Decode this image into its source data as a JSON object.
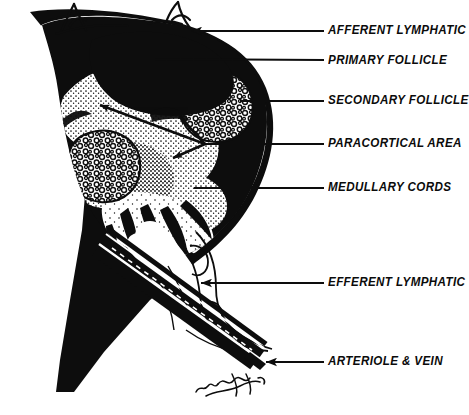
{
  "figure": {
    "ink_color": "#0d0d0d",
    "background_color": "#ffffff",
    "signature": "w.s.brunet"
  },
  "labels": [
    {
      "id": "afferent-lymphatic",
      "text": "AFFERENT LYMPHATIC",
      "x": 328,
      "y": 23,
      "leader": {
        "type": "arrow",
        "x1": 324,
        "y1": 31,
        "x2": 191,
        "y2": 31
      }
    },
    {
      "id": "primary-follicle",
      "text": "PRIMARY FOLLICLE",
      "x": 328,
      "y": 53,
      "leader": {
        "type": "line",
        "x1": 324,
        "y1": 60,
        "x2": 154,
        "y2": 59
      }
    },
    {
      "id": "secondary-follicle",
      "text": "SECONDARY FOLLICLE",
      "x": 328,
      "y": 93,
      "leader": {
        "type": "line",
        "x1": 324,
        "y1": 101,
        "x2": 240,
        "y2": 101
      }
    },
    {
      "id": "paracortical-area",
      "text": "PARACORTICAL AREA",
      "x": 328,
      "y": 136,
      "leader": {
        "type": "line",
        "x1": 324,
        "y1": 144,
        "x2": 205,
        "y2": 144
      }
    },
    {
      "id": "medullary-cords",
      "text": "MEDULLARY CORDS",
      "x": 328,
      "y": 180,
      "leader": {
        "type": "line",
        "x1": 324,
        "y1": 188,
        "x2": 194,
        "y2": 188
      }
    },
    {
      "id": "efferent-lymphatic",
      "text": "EFFERENT LYMPHATIC",
      "x": 328,
      "y": 275,
      "leader": {
        "type": "arrow",
        "x1": 324,
        "y1": 283,
        "x2": 201,
        "y2": 283
      }
    },
    {
      "id": "arteriole-and-vein",
      "text": "ARTERIOLE & VEIN",
      "x": 328,
      "y": 354,
      "leader": {
        "type": "arrow",
        "x1": 324,
        "y1": 362,
        "x2": 266,
        "y2": 362
      }
    }
  ],
  "internal_arrows": [
    {
      "id": "arrow-to-secondary-follicle-left",
      "x1": 205,
      "y1": 144,
      "x2": 96,
      "y2": 103
    },
    {
      "id": "arrow-to-paracortex-upper",
      "x1": 205,
      "y1": 144,
      "x2": 176,
      "y2": 113
    },
    {
      "id": "arrow-to-paracortex-lower",
      "x1": 205,
      "y1": 144,
      "x2": 170,
      "y2": 160
    }
  ],
  "structures": [
    {
      "id": "capsule",
      "name": "Capsule"
    },
    {
      "id": "subcapsular-sinus",
      "name": "Subcapsular sinus"
    },
    {
      "id": "primary-follicle",
      "name": "Primary follicle"
    },
    {
      "id": "secondary-follicle-1",
      "name": "Secondary follicle (upper)"
    },
    {
      "id": "secondary-follicle-2",
      "name": "Secondary follicle (lower)"
    },
    {
      "id": "paracortical-area",
      "name": "Paracortical area"
    },
    {
      "id": "medullary-cords",
      "name": "Medullary cords"
    },
    {
      "id": "hilum",
      "name": "Hilum"
    },
    {
      "id": "afferent-lymphatic",
      "name": "Afferent lymphatic vessels"
    },
    {
      "id": "efferent-lymphatic",
      "name": "Efferent lymphatic vessel"
    },
    {
      "id": "arteriole-and-vein",
      "name": "Arteriole and vein"
    }
  ]
}
